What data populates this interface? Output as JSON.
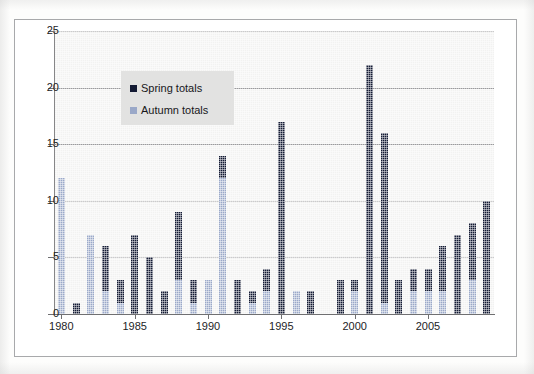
{
  "chart_data": {
    "type": "bar",
    "stacked": true,
    "title": "",
    "subtitle": "",
    "xlabel": "",
    "ylabel": "",
    "ylim": [
      0,
      25
    ],
    "ytick_values": [
      0,
      5,
      10,
      15,
      20,
      25
    ],
    "ytick_labels": [
      "0",
      "5",
      "10",
      "15",
      "20",
      "25"
    ],
    "xlim_years": [
      1980,
      2009
    ],
    "xtick_labels": [
      "1980",
      "1985",
      "1990",
      "1995",
      "2000",
      "2005"
    ],
    "xtick_years": [
      1980,
      1985,
      1990,
      1995,
      2000,
      2005
    ],
    "grid": "horizontal",
    "legend_position": "upper-left-inside",
    "legend": [
      {
        "name": "Spring totals",
        "color": "#131a33"
      },
      {
        "name": "Autumn totals",
        "color": "#9aa8c8"
      }
    ],
    "categories": [
      "1980",
      "1981",
      "1982",
      "1983",
      "1984",
      "1985",
      "1986",
      "1987",
      "1988",
      "1989",
      "1990",
      "1991",
      "1992",
      "1993",
      "1994",
      "1995",
      "1996",
      "1997",
      "1998",
      "1999",
      "2000",
      "2001",
      "2002",
      "2003",
      "2004",
      "2005",
      "2006",
      "2007",
      "2008",
      "2009"
    ],
    "series": [
      {
        "name": "Autumn totals",
        "color": "#9aa8c8",
        "values": [
          12,
          0,
          7,
          2,
          1,
          0,
          0,
          0,
          3,
          1,
          3,
          12,
          0,
          1,
          2,
          0,
          2,
          0,
          0,
          0,
          2,
          0,
          1,
          0,
          2,
          2,
          2,
          0,
          3,
          0
        ]
      },
      {
        "name": "Spring totals",
        "color": "#131a33",
        "values": [
          0,
          1,
          0,
          4,
          2,
          7,
          5,
          2,
          6,
          2,
          0,
          2,
          3,
          1,
          2,
          17,
          0,
          2,
          2,
          0,
          1,
          22,
          15,
          3,
          2,
          2,
          4,
          7,
          5,
          10
        ]
      }
    ],
    "totals": [
      12,
      1,
      7,
      6,
      3,
      7,
      5,
      2,
      9,
      3,
      3,
      14,
      3,
      2,
      4,
      17,
      2,
      2,
      2,
      0,
      3,
      22,
      16,
      3,
      4,
      4,
      6,
      7,
      8,
      10
    ],
    "bars": [
      {
        "year": "1980",
        "autumn": 12,
        "spring": 0,
        "total": 12
      },
      {
        "year": "1981",
        "autumn": 0,
        "spring": 1,
        "total": 1
      },
      {
        "year": "1982",
        "autumn": 7,
        "spring": 0,
        "total": 7
      },
      {
        "year": "1983",
        "autumn": 2,
        "spring": 4,
        "total": 6
      },
      {
        "year": "1984",
        "autumn": 1,
        "spring": 2,
        "total": 3
      },
      {
        "year": "1985",
        "autumn": 0,
        "spring": 7,
        "total": 7
      },
      {
        "year": "1986",
        "autumn": 0,
        "spring": 5,
        "total": 5
      },
      {
        "year": "1987",
        "autumn": 0,
        "spring": 2,
        "total": 2
      },
      {
        "year": "1988",
        "autumn": 3,
        "spring": 6,
        "total": 9
      },
      {
        "year": "1989",
        "autumn": 1,
        "spring": 2,
        "total": 3
      },
      {
        "year": "1990",
        "autumn": 3,
        "spring": 0,
        "total": 3
      },
      {
        "year": "1991",
        "autumn": 12,
        "spring": 2,
        "total": 14
      },
      {
        "year": "1992",
        "autumn": 0,
        "spring": 3,
        "total": 3
      },
      {
        "year": "1993",
        "autumn": 1,
        "spring": 1,
        "total": 2
      },
      {
        "year": "1994",
        "autumn": 2,
        "spring": 2,
        "total": 4
      },
      {
        "year": "1995",
        "autumn": 0,
        "spring": 17,
        "total": 17
      },
      {
        "year": "1996",
        "autumn": 2,
        "spring": 0,
        "total": 2
      },
      {
        "year": "1997",
        "autumn": 0,
        "spring": 2,
        "total": 2
      },
      {
        "year": "1998",
        "autumn": 0,
        "spring": 0,
        "total": 0
      },
      {
        "year": "1999",
        "autumn": 0,
        "spring": 3,
        "total": 3
      },
      {
        "year": "2000",
        "autumn": 2,
        "spring": 1,
        "total": 3
      },
      {
        "year": "2001",
        "autumn": 0,
        "spring": 22,
        "total": 22
      },
      {
        "year": "2002",
        "autumn": 1,
        "spring": 15,
        "total": 16
      },
      {
        "year": "2003",
        "autumn": 0,
        "spring": 3,
        "total": 3
      },
      {
        "year": "2004",
        "autumn": 2,
        "spring": 2,
        "total": 4
      },
      {
        "year": "2005",
        "autumn": 2,
        "spring": 2,
        "total": 4
      },
      {
        "year": "2006",
        "autumn": 2,
        "spring": 4,
        "total": 6
      },
      {
        "year": "2007",
        "autumn": 0,
        "spring": 7,
        "total": 7
      },
      {
        "year": "2008",
        "autumn": 3,
        "spring": 5,
        "total": 8
      },
      {
        "year": "2009",
        "autumn": 0,
        "spring": 10,
        "total": 10
      }
    ]
  },
  "colors": {
    "spring": "#131a33",
    "autumn": "#9aa8c8",
    "plot_background": "#f2f2f1",
    "legend_background": "#e2e2e1",
    "gridline": "#9a9a9c",
    "frame": "#a8a9ab",
    "text": "#1d1d1f"
  }
}
